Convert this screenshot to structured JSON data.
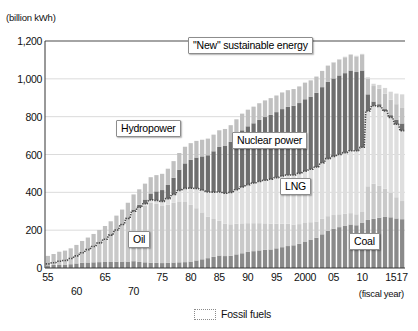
{
  "chart_data": {
    "type": "bar",
    "stacked": true,
    "title": "",
    "unit_label": "(billion kWh)",
    "xlabel": "(fiscal year)",
    "ylabel": "",
    "ylim": [
      0,
      1200
    ],
    "yticks": [
      0,
      200,
      400,
      600,
      800,
      1000,
      1200
    ],
    "ytick_labels": [
      "0",
      "200",
      "400",
      "600",
      "800",
      "1,000",
      "1,200"
    ],
    "grid": true,
    "legend_position": "bottom-center",
    "legend": [
      {
        "label": "Fossil fuels",
        "style": "dotted-outline",
        "color": "#8a8a8a"
      }
    ],
    "xtick_labels_row1": [
      "55",
      "65",
      "75",
      "80",
      "85",
      "90",
      "95",
      "2000",
      "05",
      "10",
      "15",
      "17"
    ],
    "xtick_labels_row2": [
      "60",
      "70"
    ],
    "categories": [
      "55",
      "56",
      "57",
      "58",
      "59",
      "60",
      "61",
      "62",
      "63",
      "64",
      "65",
      "66",
      "67",
      "68",
      "69",
      "70",
      "71",
      "72",
      "73",
      "74",
      "75",
      "76",
      "77",
      "78",
      "79",
      "80",
      "81",
      "82",
      "83",
      "84",
      "85",
      "86",
      "87",
      "88",
      "89",
      "90",
      "91",
      "92",
      "93",
      "94",
      "95",
      "96",
      "97",
      "98",
      "99",
      "2000",
      "01",
      "02",
      "03",
      "04",
      "05",
      "06",
      "07",
      "08",
      "09",
      "10",
      "11",
      "12",
      "13",
      "14",
      "15",
      "16",
      "17"
    ],
    "series": [
      {
        "name": "Coal",
        "color": "#8a8a8a",
        "values": [
          14,
          16,
          18,
          18,
          20,
          24,
          27,
          29,
          30,
          31,
          32,
          32,
          33,
          34,
          34,
          36,
          32,
          30,
          28,
          27,
          26,
          27,
          29,
          30,
          31,
          34,
          40,
          46,
          52,
          59,
          66,
          63,
          65,
          72,
          78,
          85,
          89,
          93,
          96,
          98,
          104,
          110,
          116,
          120,
          128,
          140,
          150,
          160,
          178,
          196,
          208,
          216,
          224,
          230,
          226,
          240,
          254,
          260,
          266,
          270,
          268,
          262,
          258
        ]
      },
      {
        "name": "Oil",
        "color": "#c9c9c9",
        "values": [
          8,
          12,
          18,
          22,
          30,
          40,
          54,
          68,
          84,
          102,
          120,
          142,
          168,
          196,
          228,
          262,
          282,
          300,
          318,
          312,
          302,
          308,
          316,
          322,
          318,
          300,
          276,
          248,
          220,
          200,
          184,
          172,
          166,
          162,
          158,
          152,
          148,
          144,
          140,
          136,
          130,
          124,
          118,
          110,
          104,
          98,
          92,
          86,
          82,
          78,
          72,
          68,
          64,
          60,
          58,
          56,
          178,
          186,
          170,
          150,
          130,
          112,
          96
        ]
      },
      {
        "name": "LNG",
        "color": "#dedede",
        "values": [
          0,
          0,
          0,
          0,
          0,
          0,
          0,
          0,
          0,
          0,
          0,
          0,
          0,
          0,
          0,
          2,
          6,
          10,
          14,
          18,
          24,
          32,
          44,
          58,
          72,
          88,
          104,
          118,
          130,
          142,
          152,
          160,
          168,
          180,
          192,
          204,
          212,
          220,
          228,
          236,
          244,
          252,
          258,
          262,
          268,
          274,
          280,
          288,
          296,
          304,
          310,
          316,
          322,
          330,
          336,
          342,
          398,
          412,
          418,
          410,
          398,
          386,
          372
        ]
      },
      {
        "name": "Nuclear power",
        "color": "#6e6e6e",
        "values": [
          0,
          0,
          0,
          0,
          0,
          0,
          0,
          0,
          0,
          0,
          0,
          1,
          2,
          3,
          5,
          9,
          14,
          22,
          34,
          48,
          60,
          72,
          88,
          110,
          132,
          150,
          164,
          178,
          194,
          216,
          238,
          252,
          268,
          284,
          300,
          308,
          316,
          326,
          334,
          340,
          346,
          354,
          360,
          366,
          372,
          380,
          384,
          392,
          400,
          406,
          412,
          418,
          420,
          424,
          416,
          406,
          88,
          22,
          12,
          10,
          12,
          24,
          38
        ]
      },
      {
        "name": "Hydropower",
        "color": "#c0c0c0",
        "values": [
          42,
          46,
          50,
          52,
          54,
          58,
          62,
          64,
          66,
          68,
          70,
          72,
          74,
          76,
          78,
          80,
          82,
          84,
          86,
          86,
          86,
          86,
          88,
          88,
          88,
          88,
          88,
          88,
          88,
          88,
          88,
          88,
          88,
          88,
          88,
          88,
          88,
          88,
          88,
          88,
          88,
          88,
          88,
          88,
          88,
          88,
          86,
          86,
          86,
          86,
          84,
          84,
          84,
          82,
          82,
          82,
          82,
          82,
          82,
          82,
          82,
          82,
          82
        ]
      },
      {
        "name": "\"New\" sustainable energy",
        "color": "#d6d6d6",
        "values": [
          0,
          0,
          0,
          0,
          0,
          0,
          0,
          0,
          0,
          0,
          0,
          0,
          0,
          0,
          0,
          0,
          0,
          0,
          0,
          0,
          0,
          0,
          0,
          0,
          0,
          0,
          0,
          0,
          0,
          0,
          0,
          0,
          0,
          0,
          0,
          0,
          0,
          0,
          0,
          0,
          0,
          0,
          0,
          0,
          0,
          0,
          0,
          0,
          0,
          0,
          2,
          2,
          3,
          4,
          4,
          6,
          8,
          12,
          20,
          30,
          42,
          56,
          72
        ]
      }
    ],
    "overlay_line": {
      "name": "Fossil fuels",
      "style": "dotted",
      "color": "#4a4a4a",
      "description": "Dotted line tracing the cumulative total of Coal + Oil + LNG",
      "values": [
        22,
        28,
        36,
        40,
        50,
        64,
        81,
        97,
        114,
        133,
        152,
        174,
        201,
        230,
        262,
        300,
        320,
        340,
        360,
        357,
        352,
        367,
        389,
        410,
        421,
        422,
        420,
        412,
        402,
        401,
        402,
        395,
        399,
        414,
        428,
        441,
        449,
        457,
        464,
        470,
        478,
        486,
        492,
        492,
        500,
        512,
        522,
        534,
        556,
        578,
        590,
        600,
        610,
        620,
        620,
        638,
        830,
        858,
        854,
        830,
        796,
        760,
        726
      ]
    },
    "callouts": [
      {
        "id": "new-sustainable",
        "label": "\"New\" sustainable energy"
      },
      {
        "id": "hydropower",
        "label": "Hydropower"
      },
      {
        "id": "nuclear-power",
        "label": "Nuclear power"
      },
      {
        "id": "lng",
        "label": "LNG"
      },
      {
        "id": "oil",
        "label": "Oil"
      },
      {
        "id": "coal",
        "label": "Coal"
      }
    ]
  }
}
